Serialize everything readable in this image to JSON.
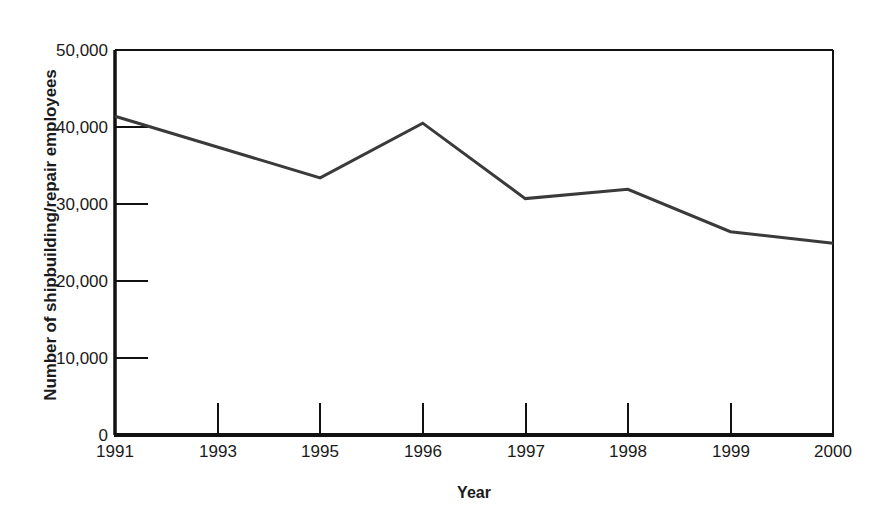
{
  "chart_data": {
    "type": "line",
    "title": "",
    "xlabel": "Year",
    "ylabel": "Number of shipbuilding/repair employees",
    "categories": [
      "1991",
      "1993",
      "1995",
      "1996",
      "1997",
      "1998",
      "1999",
      "2000"
    ],
    "x": [
      1991,
      1993,
      1995,
      1996,
      1997,
      1998,
      1999,
      2000
    ],
    "values": [
      41400,
      37200,
      33400,
      40500,
      30700,
      31900,
      26400,
      24900
    ],
    "series": [
      {
        "name": "Number of shipbuilding/repair employees",
        "values": [
          41400,
          37200,
          33400,
          40500,
          30700,
          31900,
          26400,
          24900
        ],
        "color": "#333333"
      }
    ],
    "vertices": [
      {
        "x": "1991",
        "y": 41400
      },
      {
        "x": "1995",
        "y": 33400
      },
      {
        "x": "1996",
        "y": 40500
      },
      {
        "x": "1997",
        "y": 30700
      },
      {
        "x": "1998",
        "y": 31900
      },
      {
        "x": "1999",
        "y": 26400
      },
      {
        "x": "2000",
        "y": 24900
      }
    ],
    "ylim": [
      0,
      50000
    ],
    "ytick_values": [
      0,
      10000,
      20000,
      30000,
      40000,
      50000
    ],
    "ytick_labels": [
      "0",
      "10,000",
      "20,000",
      "30,000",
      "40,000",
      "50,000"
    ],
    "grid": false,
    "legend": "none",
    "line_color": "#333333",
    "axis_color": "#000000",
    "background": "#ffffff"
  },
  "axes": {
    "y_title": "Number of shipbuilding/repair employees",
    "x_title": "Year",
    "y_labels": [
      "50,000",
      "40,000",
      "30,000",
      "20,000",
      "10,000",
      "0"
    ],
    "x_labels": [
      "1991",
      "1993",
      "1995",
      "1996",
      "1997",
      "1998",
      "1999",
      "2000"
    ]
  }
}
